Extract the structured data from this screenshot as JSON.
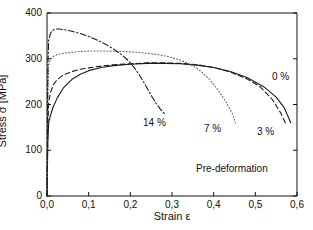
{
  "chart_data": {
    "type": "line",
    "title": "",
    "xlabel": "Strain ε",
    "ylabel": "Stress σ [MPa]",
    "xlim": [
      0.0,
      0.6
    ],
    "ylim": [
      0,
      400
    ],
    "xticks": [
      "0,0",
      "0,1",
      "0,2",
      "0,3",
      "0,4",
      "0,5",
      "0,6"
    ],
    "xtick_values": [
      0.0,
      0.1,
      0.2,
      0.3,
      0.4,
      0.5,
      0.6
    ],
    "yticks": [
      "0",
      "100",
      "200",
      "300",
      "400"
    ],
    "ytick_values": [
      0,
      100,
      200,
      300,
      400
    ],
    "grid": false,
    "legend": "inline-labels",
    "annotation": "Pre-deformation",
    "series": [
      {
        "name": "0 %",
        "label": "0 %",
        "style": "solid",
        "color": "#1a1a1a",
        "points": [
          [
            0.0,
            0
          ],
          [
            0.002,
            120
          ],
          [
            0.004,
            160
          ],
          [
            0.008,
            175
          ],
          [
            0.015,
            195
          ],
          [
            0.025,
            215
          ],
          [
            0.04,
            237
          ],
          [
            0.06,
            255
          ],
          [
            0.08,
            266
          ],
          [
            0.1,
            274
          ],
          [
            0.13,
            281
          ],
          [
            0.16,
            285
          ],
          [
            0.2,
            288
          ],
          [
            0.24,
            290
          ],
          [
            0.28,
            290
          ],
          [
            0.32,
            289
          ],
          [
            0.36,
            286
          ],
          [
            0.4,
            281
          ],
          [
            0.44,
            272
          ],
          [
            0.48,
            259
          ],
          [
            0.52,
            239
          ],
          [
            0.55,
            216
          ],
          [
            0.57,
            192
          ],
          [
            0.585,
            160
          ]
        ]
      },
      {
        "name": "3 %",
        "label": "3 %",
        "style": "dashed",
        "color": "#1a1a1a",
        "points": [
          [
            0.0,
            0
          ],
          [
            0.002,
            150
          ],
          [
            0.004,
            205
          ],
          [
            0.008,
            225
          ],
          [
            0.015,
            243
          ],
          [
            0.025,
            255
          ],
          [
            0.04,
            265
          ],
          [
            0.06,
            272
          ],
          [
            0.08,
            277
          ],
          [
            0.1,
            280
          ],
          [
            0.13,
            284
          ],
          [
            0.16,
            287
          ],
          [
            0.2,
            289
          ],
          [
            0.24,
            291
          ],
          [
            0.28,
            291
          ],
          [
            0.32,
            290
          ],
          [
            0.36,
            287
          ],
          [
            0.4,
            281
          ],
          [
            0.44,
            271
          ],
          [
            0.48,
            256
          ],
          [
            0.51,
            240
          ],
          [
            0.54,
            212
          ],
          [
            0.56,
            183
          ],
          [
            0.572,
            160
          ]
        ]
      },
      {
        "name": "7 %",
        "label": "7 %",
        "style": "dotted",
        "color": "#666666",
        "points": [
          [
            0.0,
            0
          ],
          [
            0.002,
            230
          ],
          [
            0.004,
            285
          ],
          [
            0.008,
            298
          ],
          [
            0.015,
            305
          ],
          [
            0.025,
            309
          ],
          [
            0.04,
            312
          ],
          [
            0.06,
            314
          ],
          [
            0.08,
            316
          ],
          [
            0.11,
            317
          ],
          [
            0.14,
            317
          ],
          [
            0.18,
            316
          ],
          [
            0.22,
            314
          ],
          [
            0.26,
            310
          ],
          [
            0.29,
            305
          ],
          [
            0.32,
            297
          ],
          [
            0.35,
            285
          ],
          [
            0.37,
            272
          ],
          [
            0.39,
            255
          ],
          [
            0.41,
            232
          ],
          [
            0.43,
            205
          ],
          [
            0.445,
            180
          ],
          [
            0.452,
            160
          ]
        ]
      },
      {
        "name": "14 %",
        "label": "14 %",
        "style": "dashdot",
        "color": "#1a1a1a",
        "points": [
          [
            0.0,
            0
          ],
          [
            0.002,
            280
          ],
          [
            0.004,
            340
          ],
          [
            0.008,
            355
          ],
          [
            0.013,
            362
          ],
          [
            0.02,
            365
          ],
          [
            0.03,
            365
          ],
          [
            0.045,
            363
          ],
          [
            0.06,
            360
          ],
          [
            0.08,
            355
          ],
          [
            0.1,
            349
          ],
          [
            0.12,
            341
          ],
          [
            0.14,
            332
          ],
          [
            0.16,
            321
          ],
          [
            0.18,
            308
          ],
          [
            0.19,
            300
          ],
          [
            0.2,
            291
          ],
          [
            0.21,
            280
          ],
          [
            0.22,
            267
          ],
          [
            0.23,
            252
          ],
          [
            0.24,
            236
          ],
          [
            0.25,
            220
          ],
          [
            0.26,
            205
          ],
          [
            0.272,
            190
          ],
          [
            0.282,
            180
          ]
        ]
      }
    ],
    "series_labels": [
      {
        "text": "0 %",
        "x_px": 272,
        "y_px": 71
      },
      {
        "text": "3 %",
        "x_px": 257,
        "y_px": 126
      },
      {
        "text": "7 %",
        "x_px": 204,
        "y_px": 123
      },
      {
        "text": "14 %",
        "x_px": 143,
        "y_px": 117
      }
    ]
  },
  "axes": {
    "x_title": "Strain ε",
    "y_title": "Stress σ [MPa]"
  }
}
